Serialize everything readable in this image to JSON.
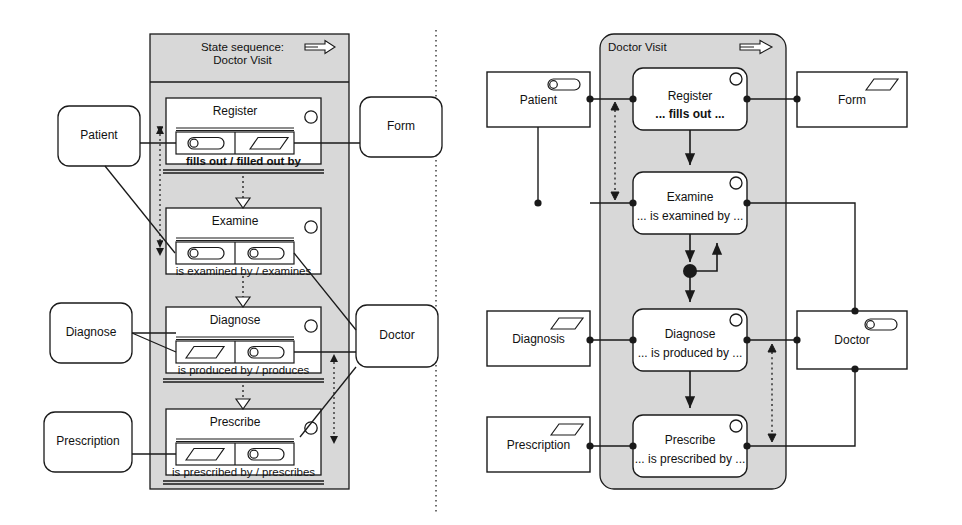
{
  "diagram": {
    "divider": "vertical-dotted-separator"
  },
  "left_panel": {
    "header_line1": "State sequence:",
    "header_line2": "Doctor Visit",
    "header_icon": "double-arrow-right-icon",
    "external_entities": [
      {
        "id": "patient",
        "label": "Patient",
        "shape": "rounded-rect"
      },
      {
        "id": "form",
        "label": "Form",
        "shape": "rounded-rect"
      },
      {
        "id": "diagnose_ext",
        "label": "Diagnose",
        "shape": "rounded-rect"
      },
      {
        "id": "doctor",
        "label": "Doctor",
        "shape": "rounded-rect"
      },
      {
        "id": "prescription",
        "label": "Prescription",
        "shape": "rounded-rect"
      }
    ],
    "states": [
      {
        "id": "register",
        "name": "Register",
        "role": "fills out / filled out by",
        "role_bold": true,
        "left_icon": "capsule-actor-icon",
        "right_icon": "parallelogram-object-icon",
        "corner_icon": "circle-icon"
      },
      {
        "id": "examine",
        "name": "Examine",
        "role": "is examined by / examines",
        "role_bold": false,
        "left_icon": "capsule-actor-icon",
        "right_icon": "capsule-actor-icon",
        "corner_icon": "circle-icon"
      },
      {
        "id": "diagnose",
        "name": "Diagnose",
        "role": "is produced by / produces",
        "role_bold": false,
        "left_icon": "parallelogram-object-icon",
        "right_icon": "capsule-actor-icon",
        "corner_icon": "circle-icon"
      },
      {
        "id": "prescribe",
        "name": "Prescribe",
        "role": "is prescribed by / prescribes",
        "role_bold": false,
        "left_icon": "parallelogram-object-icon",
        "right_icon": "capsule-actor-icon",
        "corner_icon": "circle-icon"
      }
    ],
    "flow_connectors": [
      {
        "from": "register",
        "to": "examine",
        "style": "dotted-arrow-down"
      },
      {
        "from": "examine",
        "to": "diagnose",
        "style": "dotted-arrow-down"
      },
      {
        "from": "diagnose",
        "to": "prescribe",
        "style": "dotted-arrow-down"
      },
      {
        "from": "register",
        "to": "prescribe",
        "style": "dashed-double-arrow-vertical"
      }
    ]
  },
  "right_panel": {
    "header_title": "Doctor Visit",
    "header_icon": "double-arrow-right-icon",
    "external_entities": [
      {
        "id": "patient_r",
        "label": "Patient",
        "icon": "capsule-actor-icon",
        "shape": "rect"
      },
      {
        "id": "form_r",
        "label": "Form",
        "icon": "parallelogram-object-icon",
        "shape": "rect"
      },
      {
        "id": "diagnosis_r",
        "label": "Diagnosis",
        "icon": "parallelogram-object-icon",
        "shape": "rect"
      },
      {
        "id": "doctor_r",
        "label": "Doctor",
        "icon": "capsule-actor-icon",
        "shape": "rect"
      },
      {
        "id": "prescription_r",
        "label": "Prescription",
        "icon": "parallelogram-object-icon",
        "shape": "rect"
      }
    ],
    "states": [
      {
        "id": "register_r",
        "name": "Register",
        "role": "... fills out ...",
        "role_bold": true,
        "corner_icon": "circle-icon"
      },
      {
        "id": "examine_r",
        "name": "Examine",
        "role": "... is examined by ...",
        "role_bold": false,
        "corner_icon": "circle-icon"
      },
      {
        "id": "diagnose_r",
        "name": "Diagnose",
        "role": "... is produced by ...",
        "role_bold": false,
        "corner_icon": "circle-icon"
      },
      {
        "id": "prescribe_r",
        "name": "Prescribe",
        "role": "... is prescribed by ...",
        "role_bold": false,
        "corner_icon": "circle-icon"
      }
    ],
    "flow_connectors": [
      {
        "from": "register_r",
        "to": "examine_r",
        "style": "solid-arrow-down"
      },
      {
        "from": "examine_r",
        "to": "junction",
        "style": "solid-arrow-down"
      },
      {
        "from": "junction",
        "to": "examine_r",
        "style": "solid-arrow-loop-up"
      },
      {
        "from": "junction",
        "to": "diagnose_r",
        "style": "solid-arrow-down"
      },
      {
        "from": "diagnose_r",
        "to": "prescribe_r",
        "style": "solid-arrow-down"
      },
      {
        "from": "register_r",
        "to": "examine_r",
        "style": "dashed-double-arrow-vertical-left"
      },
      {
        "from": "diagnose_r",
        "to": "prescribe_r",
        "style": "dashed-double-arrow-vertical-right"
      }
    ],
    "junction_node": "filled-circle-junction"
  },
  "colors": {
    "panel_fill": "#d8d8d8",
    "box_fill": "#ffffff",
    "stroke": "#1a1a1a",
    "background": "#ffffff"
  }
}
